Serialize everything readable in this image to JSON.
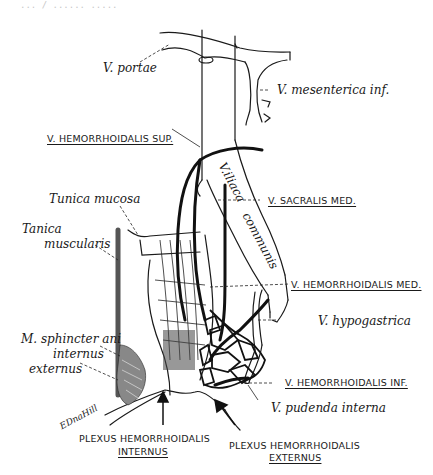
{
  "header": {
    "faded_text": "... / ...... ....."
  },
  "labels": {
    "v_portae": "V. portae",
    "v_mesenterica_inf": "V. mesenterica inf.",
    "v_hemorrhoidalis_sup": "V. HEMORRHOIDALIS SUP.",
    "v_iliaca_communis_1": "V.iliaca",
    "v_iliaca_communis_2": "communis",
    "tunica_mucosa": "Tunica mucosa",
    "tunica_muscularis_1": "Tanica",
    "tunica_muscularis_2": "muscularis",
    "v_sacralis_med": "V. SACRALIS MED.",
    "v_hemorrhoidalis_med": "V. HEMORRHOIDALIS MED.",
    "v_hypogastrica": "V. hypogastrica",
    "m_sphincter_1": "M. sphincter ani",
    "m_sphincter_2": "internus",
    "externus": "externus",
    "v_hemorrhoidalis_inf": "V. HEMORRHOIDALIS INF.",
    "v_pudenda_interna": "V. pudenda interna",
    "plexus_internus_1": "PLEXUS HEMORRHOIDALIS",
    "plexus_internus_2": "INTERNUS",
    "plexus_externus_1": "PLEXUS HEMORRHOIDALIS",
    "plexus_externus_2": "EXTERNUS",
    "signature": "EDnaHill"
  },
  "colors": {
    "ink": "#1a1a1a",
    "background": "#ffffff"
  }
}
